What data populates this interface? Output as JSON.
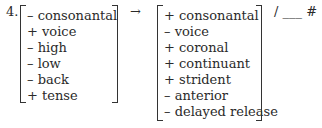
{
  "example_number": "4.",
  "input_matrix": [
    "– consonantal",
    "+ voice",
    "– high",
    "– low",
    "– back",
    "+ tense"
  ],
  "arrow": "→",
  "output_matrix": [
    "+ consonantal",
    "– voice",
    "+ coronal",
    "+ continuant",
    "+ strident",
    "– anterior",
    "– delayed release"
  ],
  "environment": "/ ___ #"
}
